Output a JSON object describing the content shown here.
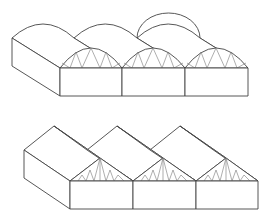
{
  "figure": {
    "line_color": "#444444",
    "truss_color": "#777777",
    "background": "#ffffff"
  },
  "diagrams": [
    {
      "name": "arched-multispan-greenhouse",
      "roof_type": "arched",
      "bays": 3,
      "truss_pattern": "zigzag"
    },
    {
      "name": "gable-multispan-greenhouse",
      "roof_type": "gable",
      "bays": 3,
      "truss_pattern": "fink"
    }
  ]
}
